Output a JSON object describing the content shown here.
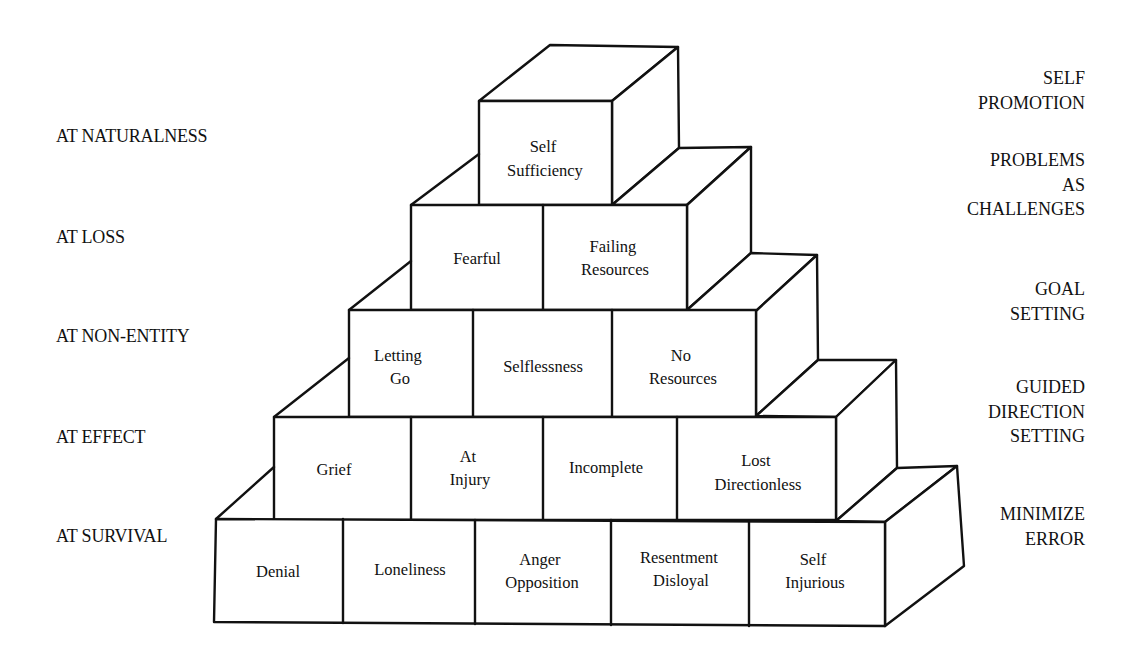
{
  "left_labels": [
    {
      "text": "AT NATURALNESS",
      "top": 127
    },
    {
      "text": "AT LOSS",
      "top": 228
    },
    {
      "text": "AT NON-ENTITY",
      "top": 327
    },
    {
      "text": "AT EFFECT",
      "top": 428
    },
    {
      "text": "AT SURVIVAL",
      "top": 527
    }
  ],
  "right_labels": [
    {
      "lines": [
        "SELF",
        "PROMOTION"
      ],
      "top": 66
    },
    {
      "lines": [
        "PROBLEMS",
        "AS",
        "CHALLENGES"
      ],
      "top": 148
    },
    {
      "lines": [
        "GOAL",
        "SETTING"
      ],
      "top": 277
    },
    {
      "lines": [
        "GUIDED",
        "DIRECTION",
        "SETTING"
      ],
      "top": 375
    },
    {
      "lines": [
        "MINIMIZE",
        "ERROR"
      ],
      "top": 502
    }
  ],
  "pyramid": {
    "rows": [
      {
        "level": 1,
        "cells": [
          [
            "Self",
            "Sufficiency"
          ]
        ]
      },
      {
        "level": 2,
        "cells": [
          [
            "Fearful"
          ],
          [
            "Failing",
            "Resources"
          ]
        ]
      },
      {
        "level": 3,
        "cells": [
          [
            "Letting",
            "Go"
          ],
          [
            "Selflessness"
          ],
          [
            "No",
            "Resources"
          ]
        ]
      },
      {
        "level": 4,
        "cells": [
          [
            "Grief"
          ],
          [
            "At",
            "Injury"
          ],
          [
            "Incomplete"
          ],
          [
            "Lost",
            "Directionless"
          ]
        ]
      },
      {
        "level": 5,
        "cells": [
          [
            "Denial"
          ],
          [
            "Loneliness"
          ],
          [
            "Anger",
            "Opposition"
          ],
          [
            "Resentment",
            "Disloyal"
          ],
          [
            "Self",
            "Injurious"
          ]
        ]
      }
    ]
  }
}
